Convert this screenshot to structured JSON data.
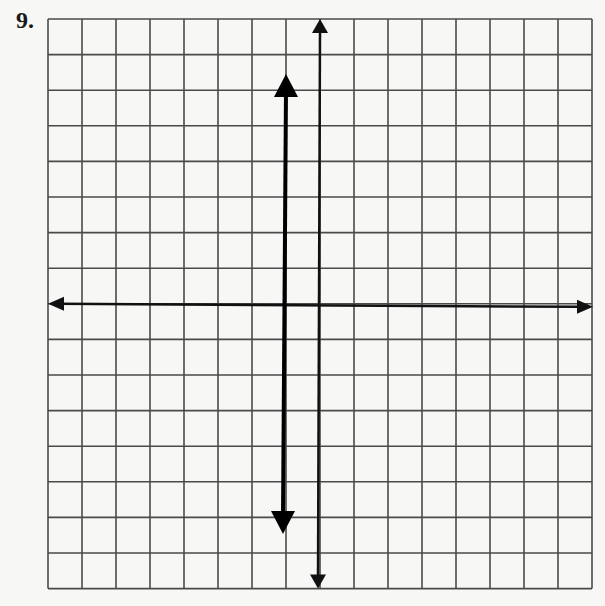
{
  "problem": {
    "number_label": "9."
  },
  "grid": {
    "columns": 16,
    "rows": 16,
    "left": 48,
    "top": 19,
    "cell_width": 34.0,
    "cell_height": 35.6,
    "line_color": "#4a4a4a",
    "background_color": "#f7f7f6"
  },
  "axes": {
    "x_axis": {
      "row_index": 8,
      "color": "#111111",
      "arrows": "both"
    },
    "y_axis": {
      "column_index": 8,
      "color": "#111111",
      "arrows": "both"
    }
  },
  "graphed_line": {
    "type": "vertical",
    "equation": "x = -1",
    "column_index": 7,
    "top_arrow_y": 74,
    "bottom_arrow_y": 534,
    "color": "#000000",
    "arrows": "both"
  },
  "chart_data": {
    "type": "line",
    "title": "",
    "xlabel": "",
    "ylabel": "",
    "grid": true,
    "xlim": [
      -8,
      8
    ],
    "ylim": [
      -8,
      8
    ],
    "series": [
      {
        "name": "x = -1",
        "x": [
          -1,
          -1
        ],
        "y": [
          6.5,
          -6.4
        ]
      }
    ]
  }
}
